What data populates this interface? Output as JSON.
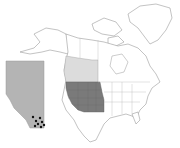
{
  "map": {
    "title": "",
    "description": "Distribution map of North America with inset of Alberta",
    "colors": {
      "background": "#ffffff",
      "land": "#ffffff",
      "outline": "#9a9a9a",
      "us_range": "#7a7a7a",
      "canada_range": "#dcdcdc",
      "inset_fill": "#b4b4b4",
      "occurrence_dot": "#111111"
    },
    "regions": {
      "us_range": {
        "label": "Western United States (shaded dark)",
        "states": [
          "WA",
          "OR",
          "CA",
          "ID",
          "NV",
          "MT",
          "WY",
          "UT",
          "CO",
          "AZ",
          "NM"
        ]
      },
      "canada_range": {
        "label": "Western Canada (shaded light)",
        "provinces": [
          "BC",
          "AB",
          "SK"
        ]
      }
    },
    "inset": {
      "label": "Alberta",
      "occurrences": [
        {
          "x": 33,
          "y": 117
        },
        {
          "x": 36,
          "y": 121
        },
        {
          "x": 38,
          "y": 124
        },
        {
          "x": 40,
          "y": 118
        },
        {
          "x": 42,
          "y": 122
        },
        {
          "x": 44,
          "y": 125
        },
        {
          "x": 46,
          "y": 120
        },
        {
          "x": 41,
          "y": 127
        },
        {
          "x": 35,
          "y": 126
        }
      ]
    }
  }
}
